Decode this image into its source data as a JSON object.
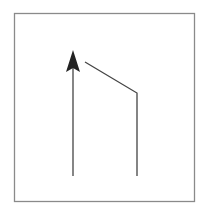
{
  "diagram": {
    "frame": {
      "x": 14,
      "y": 13,
      "width": 180,
      "height": 188,
      "stroke": "#8a8a8a"
    },
    "arrow": {
      "x": 73,
      "y_bottom": 176,
      "y_tip": 50,
      "color": "#333333"
    },
    "bent_line": {
      "points": "85,62 137,93 137,176",
      "color": "#444444"
    }
  }
}
